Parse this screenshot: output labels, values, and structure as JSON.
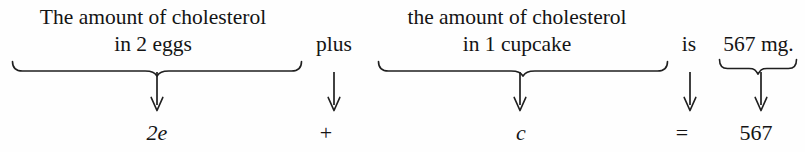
{
  "figure": {
    "type": "word-problem-to-equation-translation",
    "phrases": [
      {
        "id": "eggs",
        "line1": "The amount of cholesterol",
        "line2": "in 2 eggs",
        "has_brace": true,
        "term": "2e"
      },
      {
        "id": "cupcake",
        "line1": "the amount of cholesterol",
        "line2": "in 1 cupcake",
        "has_brace": true,
        "term": "c"
      },
      {
        "id": "mg",
        "line1": "",
        "line2": "567 mg.",
        "has_brace": true,
        "term": "567"
      }
    ],
    "connectors": [
      {
        "id": "plus",
        "word": "plus",
        "symbol": "+"
      },
      {
        "id": "is",
        "word": "is",
        "symbol": "="
      }
    ],
    "arrows": {
      "glyph": "down-arrow",
      "count": 5
    },
    "equation": "2e + c = 567",
    "colors": {
      "ink": "#141414",
      "background": "#fefefe",
      "brace_stroke": "#1f1f1f"
    }
  }
}
